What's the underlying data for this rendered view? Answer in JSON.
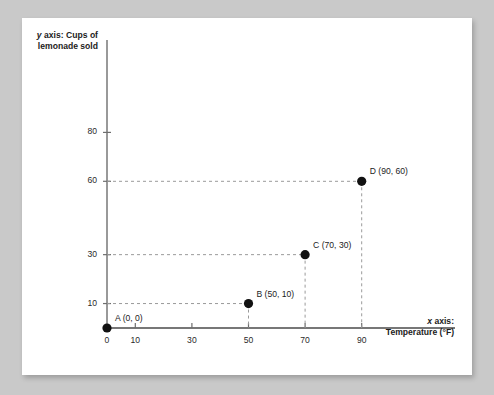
{
  "page": {
    "background_color": "#c9c9c9",
    "card_color": "#ffffff"
  },
  "chart_data": {
    "type": "scatter",
    "title": "",
    "xlabel_line1": "x axis:",
    "xlabel_line2": "Temperature (°F)",
    "ylabel_line1": "y axis: Cups of",
    "ylabel_line2": "lemonade sold",
    "x_italic_prefix": "x",
    "y_italic_prefix": "y",
    "xticks": [
      0,
      10,
      30,
      50,
      70,
      90
    ],
    "xtick_labels": [
      "0",
      "10",
      "30",
      "50",
      "70",
      "90"
    ],
    "yticks": [
      10,
      30,
      60,
      80
    ],
    "ytick_labels": [
      "10",
      "30",
      "60",
      "80"
    ],
    "xlim": [
      0,
      100
    ],
    "ylim": [
      0,
      90
    ],
    "grid": false,
    "guide_lines": "dashed",
    "legend": "none",
    "point_color": "#111111",
    "axis_color": "#6e6e6e",
    "guide_color": "#9a9a9a",
    "points": [
      {
        "name": "A",
        "x": 0,
        "y": 0,
        "label": "A (0, 0)",
        "label_pos": "right"
      },
      {
        "name": "B",
        "x": 50,
        "y": 10,
        "label": "B (50, 10)",
        "label_pos": "right"
      },
      {
        "name": "C",
        "x": 70,
        "y": 30,
        "label": "C (70, 30)",
        "label_pos": "right"
      },
      {
        "name": "D",
        "x": 90,
        "y": 60,
        "label": "D (90, 60)",
        "label_pos": "right"
      }
    ]
  }
}
